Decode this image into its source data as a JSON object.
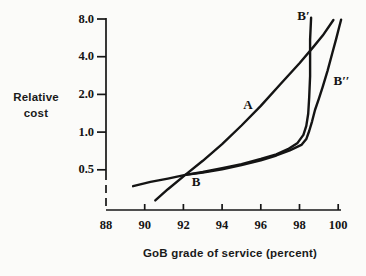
{
  "colors": {
    "ink": "#141414",
    "background": "#fbfbf9"
  },
  "chart_data": {
    "type": "line",
    "title": "",
    "xlabel": "GoB grade of service (percent)",
    "ylabel": "Relative cost",
    "x_axis": {
      "min": 88,
      "max": 100,
      "ticks": [
        88,
        90,
        92,
        94,
        96,
        98,
        100
      ],
      "tick_labels": [
        "88",
        "90",
        "92",
        "94",
        "96",
        "98",
        "100"
      ],
      "scale": "linear"
    },
    "y_axis": {
      "min": 0.25,
      "max": 8.5,
      "ticks": [
        8.0,
        4.0,
        2.0,
        1.0,
        0.5
      ],
      "tick_labels": [
        "8.0",
        "4.0",
        "2.0",
        "1.0",
        "0.5"
      ],
      "scale": "log2",
      "dashed_axis_below": 0.5
    },
    "grid": "off",
    "legend": "none",
    "series": [
      {
        "name": "A",
        "label": "A",
        "points": [
          [
            90.55,
            0.285
          ],
          [
            91.2,
            0.35
          ],
          [
            92.1,
            0.455
          ],
          [
            93,
            0.59
          ],
          [
            94,
            0.8
          ],
          [
            95,
            1.13
          ],
          [
            96,
            1.62
          ],
          [
            97,
            2.4
          ],
          [
            98,
            3.55
          ],
          [
            98.7,
            4.75
          ],
          [
            99.2,
            5.9
          ],
          [
            99.75,
            7.85
          ]
        ]
      },
      {
        "name": "B-Bprime",
        "label": "B′",
        "points": [
          [
            89.4,
            0.37
          ],
          [
            90.3,
            0.4
          ],
          [
            91.2,
            0.425
          ],
          [
            92.1,
            0.455
          ],
          [
            93,
            0.48
          ],
          [
            94,
            0.515
          ],
          [
            95,
            0.555
          ],
          [
            96,
            0.61
          ],
          [
            96.8,
            0.665
          ],
          [
            97.4,
            0.73
          ],
          [
            97.9,
            0.82
          ],
          [
            98.2,
            0.95
          ],
          [
            98.35,
            1.12
          ],
          [
            98.45,
            1.4
          ],
          [
            98.5,
            1.9
          ],
          [
            98.55,
            2.8
          ],
          [
            98.55,
            4.0
          ],
          [
            98.55,
            5.5
          ],
          [
            98.6,
            8.2
          ]
        ]
      },
      {
        "name": "B-Bdoubleprime",
        "label": "B′′",
        "points": [
          [
            92.1,
            0.455
          ],
          [
            93,
            0.475
          ],
          [
            94,
            0.505
          ],
          [
            95,
            0.545
          ],
          [
            96,
            0.595
          ],
          [
            96.8,
            0.65
          ],
          [
            97.5,
            0.715
          ],
          [
            98.1,
            0.79
          ],
          [
            98.35,
            0.88
          ],
          [
            98.5,
            1.02
          ],
          [
            98.65,
            1.22
          ],
          [
            98.8,
            1.5
          ],
          [
            99.0,
            1.85
          ],
          [
            99.2,
            2.3
          ],
          [
            99.45,
            3.1
          ],
          [
            99.7,
            4.3
          ],
          [
            99.9,
            5.6
          ],
          [
            100.05,
            6.9
          ],
          [
            100.15,
            7.9
          ]
        ]
      }
    ],
    "point_labels": [
      {
        "text": "B",
        "x": 92.3,
        "y": 0.42
      }
    ]
  }
}
